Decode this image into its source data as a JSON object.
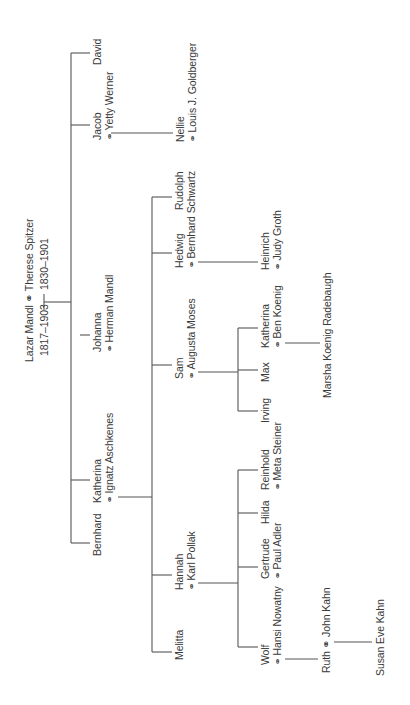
{
  "diagram": {
    "type": "family-tree",
    "orientation": "rotated -90deg",
    "marriage_symbol": "⚭",
    "root": {
      "name": "Lazar Mandl",
      "spouse": "Therese Spitzer",
      "label": "Lazar Mandl ⚭ Therese Spitzer",
      "dates_left": "1817–1903",
      "dates_right": "1830–1901"
    },
    "generation1": [
      {
        "name": "David"
      },
      {
        "name": "Jacob",
        "spouse": "Yetty Werner"
      },
      {
        "name": "Johanna",
        "spouse": "Herman Mandl"
      },
      {
        "name": "Katherina",
        "spouse": "Ignatz Aschkenes"
      },
      {
        "name": "Bernhard"
      }
    ],
    "generation2": [
      {
        "name": "Nellie",
        "spouse": "Louis J. Goldberger",
        "parent": "Jacob"
      },
      {
        "name": "Rudolph",
        "parent": "Katherina"
      },
      {
        "name": "Hedwig",
        "spouse": "Bernhard Schwartz",
        "parent": "Katherina"
      },
      {
        "name": "Sam",
        "spouse": "Augusta Moses",
        "parent": "Katherina"
      },
      {
        "name": "Hannah",
        "spouse": "Karl Pollak",
        "parent": "Katherina"
      },
      {
        "name": "Melitta",
        "parent": "Katherina"
      }
    ],
    "generation3": [
      {
        "name": "Heinrich",
        "spouse": "Judy Groth",
        "parent": "Hedwig"
      },
      {
        "name": "Katherina",
        "spouse": "Ben Koenig",
        "parent": "Sam"
      },
      {
        "name": "Max",
        "parent": "Sam"
      },
      {
        "name": "Irving",
        "parent": "Sam"
      },
      {
        "name": "Reinhold",
        "spouse": "Meta Steiner",
        "parent": "Hannah"
      },
      {
        "name": "Hilda",
        "parent": "Hannah"
      },
      {
        "name": "Gertrude",
        "spouse": "Paul Adler",
        "parent": "Hannah"
      },
      {
        "name": "Wolf",
        "spouse": "Hansi Nowatny",
        "parent": "Hannah"
      }
    ],
    "generation4": [
      {
        "name": "Marsha Koenig Radebaugh",
        "parent": "Katherina (Koenig)"
      },
      {
        "name": "Ruth",
        "spouse": "John Kahn",
        "label": "Ruth ⚭ John Kahn",
        "parent": "Wolf"
      }
    ],
    "generation5": [
      {
        "name": "Susan Eve Kahn",
        "parent": "Ruth"
      }
    ]
  }
}
